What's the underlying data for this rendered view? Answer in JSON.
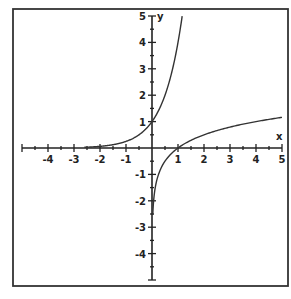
{
  "chart_data": {
    "type": "line",
    "title": "",
    "xlabel": "x",
    "ylabel": "y",
    "xlim": [
      -5,
      5
    ],
    "ylim": [
      -5,
      5
    ],
    "grid": false,
    "legend": null,
    "x_ticks": [
      -4,
      -3,
      -2,
      -1,
      1,
      2,
      3,
      4,
      5
    ],
    "x_tick_labels": [
      "-4",
      "-3",
      "-2",
      "-1",
      "1",
      "2",
      "3",
      "4",
      "5"
    ],
    "y_ticks": [
      5,
      4,
      3,
      2,
      1,
      -1,
      -2,
      -3,
      -4
    ],
    "y_tick_labels": [
      "5",
      "4",
      "3",
      "2",
      "1",
      "-1",
      "-2",
      "-3",
      "-4"
    ],
    "minor_tick_step": 0.5,
    "series": [
      {
        "name": "exponential",
        "formula": "y = 4^x",
        "x": [
          -2.5,
          -2,
          -1.5,
          -1,
          -0.5,
          0,
          0.25,
          0.5,
          0.75,
          1,
          1.16
        ],
        "y": [
          0.03,
          0.06,
          0.13,
          0.25,
          0.5,
          1,
          1.41,
          2,
          2.83,
          4,
          5
        ]
      },
      {
        "name": "logarithmic",
        "formula": "y = log4(x)",
        "x": [
          0.03,
          0.05,
          0.1,
          0.25,
          0.5,
          1,
          2,
          3,
          4,
          5
        ],
        "y": [
          -2.5,
          -2.16,
          -1.66,
          -1,
          -0.5,
          0,
          0.5,
          0.79,
          1,
          1.16
        ]
      }
    ]
  }
}
